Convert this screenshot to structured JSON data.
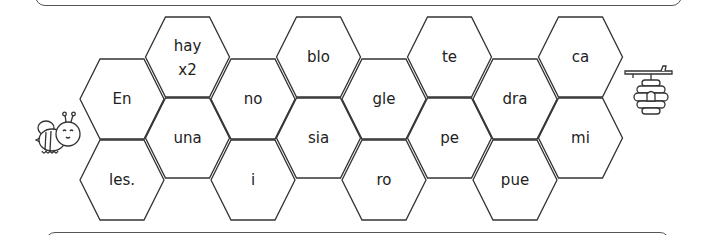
{
  "puzzle": {
    "start_icon": "bee-icon",
    "end_icon": "beehive-icon",
    "cells": [
      {
        "id": "en",
        "label": "En",
        "col": 0,
        "row": 0
      },
      {
        "id": "les",
        "label": "les.",
        "col": 0,
        "row": 1
      },
      {
        "id": "hay",
        "label": "hay",
        "label2": "x2",
        "col": 1,
        "row": 0
      },
      {
        "id": "una",
        "label": "una",
        "col": 1,
        "row": 1
      },
      {
        "id": "no",
        "label": "no",
        "col": 2,
        "row": 0
      },
      {
        "id": "i",
        "label": "i",
        "col": 2,
        "row": 1
      },
      {
        "id": "blo",
        "label": "blo",
        "col": 3,
        "row": 0
      },
      {
        "id": "sia",
        "label": "sia",
        "col": 3,
        "row": 1
      },
      {
        "id": "gle",
        "label": "gle",
        "col": 4,
        "row": 0
      },
      {
        "id": "ro",
        "label": "ro",
        "col": 4,
        "row": 1
      },
      {
        "id": "te",
        "label": "te",
        "col": 5,
        "row": 0
      },
      {
        "id": "pe",
        "label": "pe",
        "col": 5,
        "row": 1
      },
      {
        "id": "dra",
        "label": "dra",
        "col": 6,
        "row": 0
      },
      {
        "id": "pue",
        "label": "pue",
        "col": 6,
        "row": 1
      },
      {
        "id": "ca",
        "label": "ca",
        "col": 7,
        "row": 0
      },
      {
        "id": "mi",
        "label": "mi",
        "col": 7,
        "row": 1
      }
    ]
  },
  "colors": {
    "stroke": "#333333",
    "text": "#222222",
    "background": "#ffffff"
  }
}
